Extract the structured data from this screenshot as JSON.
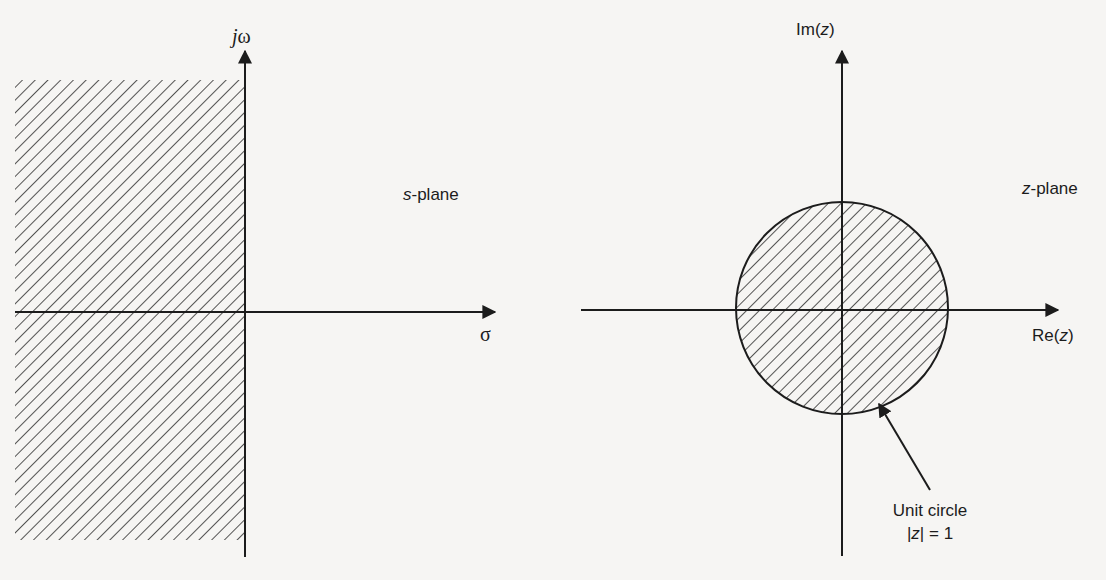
{
  "figure": {
    "colors": {
      "background": "#f6f5f3",
      "ink": "#1c1c1c",
      "hatch": "#2a2a2a"
    }
  },
  "s_plane": {
    "title_var": "s",
    "title_suffix": "-plane",
    "imag_axis_prefix": "j",
    "imag_axis_symbol": "ω",
    "real_axis_label": "σ",
    "shaded_region": "left half-plane (stable region)"
  },
  "z_plane": {
    "title_var": "z",
    "title_suffix": "-plane",
    "imag_axis_label_prefix": "Im(",
    "imag_axis_label_var": "z",
    "imag_axis_label_suffix": ")",
    "real_axis_label_prefix": "Re(",
    "real_axis_label_var": "z",
    "real_axis_label_suffix": ")",
    "shaded_region": "interior of unit circle",
    "annotation": {
      "line1": "Unit circle",
      "line2_prefix": "|",
      "line2_var": "z",
      "line2_suffix": "| = 1"
    }
  }
}
